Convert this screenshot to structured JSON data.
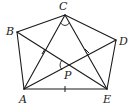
{
  "diagram": {
    "type": "geometry",
    "points": {
      "A": {
        "label": "A",
        "x": 24,
        "y": 89,
        "lx": 19,
        "ly": 103
      },
      "B": {
        "label": "B",
        "x": 17,
        "y": 32,
        "lx": 6,
        "ly": 35
      },
      "C": {
        "label": "C",
        "x": 65,
        "y": 15,
        "lx": 59,
        "ly": 10
      },
      "D": {
        "label": "D",
        "x": 116,
        "y": 40,
        "lx": 119,
        "ly": 45
      },
      "E": {
        "label": "E",
        "x": 107,
        "y": 89,
        "lx": 103,
        "ly": 103
      },
      "P": {
        "label": "P",
        "x": 69,
        "y": 65,
        "lx": 64,
        "ly": 79
      }
    },
    "segments": [
      [
        "A",
        "B"
      ],
      [
        "B",
        "C"
      ],
      [
        "C",
        "D"
      ],
      [
        "D",
        "E"
      ],
      [
        "E",
        "A"
      ],
      [
        "A",
        "C"
      ],
      [
        "C",
        "E"
      ],
      [
        "A",
        "D"
      ],
      [
        "B",
        "E"
      ]
    ],
    "equal_marks": [
      "AE",
      "BP",
      "CP"
    ],
    "angle_marks": [
      "angle ACE at C",
      "angle APB at P"
    ]
  }
}
